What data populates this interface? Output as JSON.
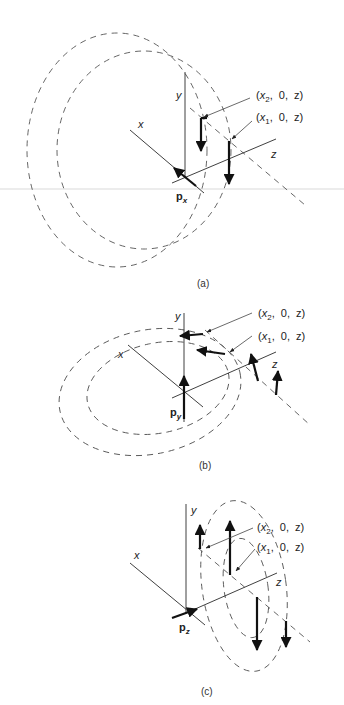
{
  "figure": {
    "panels": [
      {
        "caption": "(a)",
        "axis_labels": {
          "x": "x",
          "y": "y",
          "z": "z"
        },
        "vector_label": {
          "main": "p",
          "sub": "x"
        },
        "callouts": [
          {
            "text": "(x2, 0, z)",
            "var": "x",
            "sub": "2",
            "rest": ",  0,  z)"
          },
          {
            "text": "(x1, 0, z)",
            "var": "x",
            "sub": "1",
            "rest": ",  0,  z)"
          }
        ]
      },
      {
        "caption": "(b)",
        "axis_labels": {
          "x": "x",
          "y": "y",
          "z": "z"
        },
        "vector_label": {
          "main": "p",
          "sub": "y"
        },
        "callouts": [
          {
            "text": "(x2, 0, z)",
            "var": "x",
            "sub": "2",
            "rest": ",  0,  z)"
          },
          {
            "text": "(x1, 0, z)",
            "var": "x",
            "sub": "1",
            "rest": ",  0,  z)"
          }
        ]
      },
      {
        "caption": "(c)",
        "axis_labels": {
          "x": "x",
          "y": "y",
          "z": "z"
        },
        "vector_label": {
          "main": "p",
          "sub": "z"
        },
        "callouts": [
          {
            "text": "(x2, 0, z)",
            "var": "x",
            "sub": "2",
            "rest": ",  0,  z)"
          },
          {
            "text": "(x1, 0, z)",
            "var": "x",
            "sub": "1",
            "rest": ",  0,  z)"
          }
        ]
      }
    ],
    "open_paren": "("
  }
}
